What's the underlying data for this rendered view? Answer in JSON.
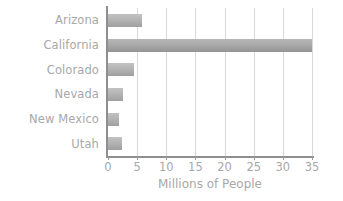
{
  "chart_data": {
    "type": "bar",
    "orientation": "horizontal",
    "title": "",
    "categories": [
      "Arizona",
      "California",
      "Colorado",
      "Nevada",
      "New Mexico",
      "Utah"
    ],
    "values": [
      5.9,
      35.0,
      4.5,
      2.5,
      1.9,
      2.4
    ],
    "xlabel": "Millions of People",
    "ylabel": "",
    "xlim": [
      0,
      35
    ],
    "xticks": [
      0,
      5,
      10,
      15,
      20,
      25,
      30,
      35
    ],
    "xtick_labels": [
      "0",
      "5",
      "10",
      "15",
      "20",
      "25",
      "30",
      "35"
    ],
    "grid": "vertical",
    "legend": "none",
    "colors": {
      "bar_light": "#c2c2c2",
      "bar_dark": "#9f9f9f",
      "axis": "#8f8f8f",
      "gridline": "#d8d8d8",
      "text": "#a8a8a8",
      "background": "#ffffff"
    }
  }
}
